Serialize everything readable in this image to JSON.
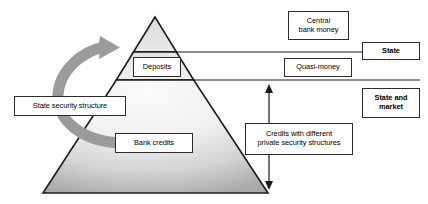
{
  "diagram": {
    "pyramid": {
      "name": "money-pyramid",
      "apex": {
        "x": 155,
        "y": 17
      },
      "base_left": {
        "x": 43,
        "y": 193
      },
      "base_right": {
        "x": 268,
        "y": 193
      },
      "divider_lines_y": [
        52,
        80
      ],
      "fill_top_color": "#e0e0e0",
      "fill_mid_color": "#f2f2f2",
      "fill_bottom_color": "#b0b0b0",
      "outline_color": "#1a1a1a"
    },
    "tiers": [
      {
        "id": "central-bank-money",
        "label": "Central\nbank money"
      },
      {
        "id": "quasi-money",
        "label": "Quasi-money"
      },
      {
        "id": "credits",
        "label": "Credits with different\nprivate security structures"
      }
    ],
    "inner_labels": [
      {
        "id": "deposits",
        "label": "Deposits"
      },
      {
        "id": "bank-credits",
        "label": "Bank credits"
      }
    ],
    "side_labels": [
      {
        "id": "state",
        "label": "State",
        "bold": true
      },
      {
        "id": "state-and-market",
        "label": "State and\nmarket",
        "bold": true
      }
    ],
    "left_label": {
      "id": "state-security-structure",
      "label": "State security structure"
    },
    "curved_arrow": {
      "name": "state-security-structure-arrow",
      "color": "#9a9a9a",
      "direction": "counterclockwise-upward"
    },
    "vertical_arrow": {
      "name": "credits-range-arrow",
      "x": 269,
      "top_y": 85,
      "bottom_y": 189,
      "color": "#1a1a1a",
      "double_headed": true
    },
    "separator_lines": [
      {
        "id": "state-boundary-line",
        "x1": 140,
        "x2": 420,
        "y": 52
      },
      {
        "id": "state-market-boundary-line",
        "x1": 126,
        "x2": 420,
        "y": 80
      }
    ]
  }
}
